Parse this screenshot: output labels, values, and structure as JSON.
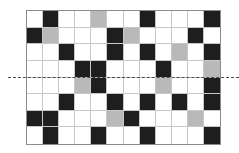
{
  "diagram": {
    "type": "tile-grid",
    "columns": 12,
    "rows": 8,
    "legend": {
      "W": "white",
      "B": "black",
      "G": "gray"
    },
    "colors": {
      "W": "#ffffff",
      "B": "#1e1e1e",
      "G": "#b9b9b9"
    },
    "cells": [
      [
        "W",
        "B",
        "W",
        "W",
        "G",
        "W",
        "W",
        "B",
        "W",
        "W",
        "W",
        "B"
      ],
      [
        "B",
        "G",
        "W",
        "W",
        "W",
        "B",
        "G",
        "W",
        "W",
        "W",
        "B",
        "W"
      ],
      [
        "W",
        "W",
        "B",
        "W",
        "W",
        "B",
        "W",
        "B",
        "W",
        "G",
        "W",
        "B"
      ],
      [
        "W",
        "W",
        "W",
        "B",
        "B",
        "W",
        "W",
        "W",
        "B",
        "W",
        "W",
        "G"
      ],
      [
        "W",
        "W",
        "W",
        "G",
        "B",
        "W",
        "W",
        "W",
        "G",
        "W",
        "W",
        "B"
      ],
      [
        "W",
        "W",
        "B",
        "W",
        "W",
        "B",
        "W",
        "B",
        "W",
        "B",
        "W",
        "B"
      ],
      [
        "B",
        "B",
        "W",
        "W",
        "W",
        "G",
        "B",
        "W",
        "W",
        "W",
        "G",
        "W"
      ],
      [
        "W",
        "B",
        "W",
        "W",
        "B",
        "W",
        "W",
        "B",
        "W",
        "W",
        "W",
        "B"
      ]
    ],
    "dashed_line": {
      "orientation": "horizontal",
      "between_rows": [
        3,
        4
      ],
      "style": "dashed"
    }
  }
}
